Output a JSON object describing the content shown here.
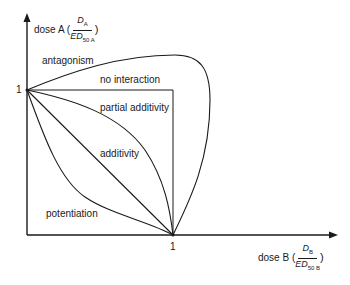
{
  "axes": {
    "y_label": "dose A (",
    "y_frac_num": "D",
    "y_frac_num_sub": "A",
    "y_frac_den": "ED",
    "y_frac_den_sub": "50 A",
    "y_close": ")",
    "x_label": "dose B (",
    "x_frac_num": "D",
    "x_frac_num_sub": "B",
    "x_frac_den": "ED",
    "x_frac_den_sub": "50 B",
    "x_close": ")",
    "y_tick": "1",
    "x_tick": "1"
  },
  "regions": {
    "antagonism": "antagonism",
    "no_interaction": "no interaction",
    "partial_additivity": "partial additivity",
    "additivity": "additivity",
    "potentiation": "potentiation"
  },
  "colors": {
    "line": "#1a1a1a",
    "background": "#ffffff"
  }
}
